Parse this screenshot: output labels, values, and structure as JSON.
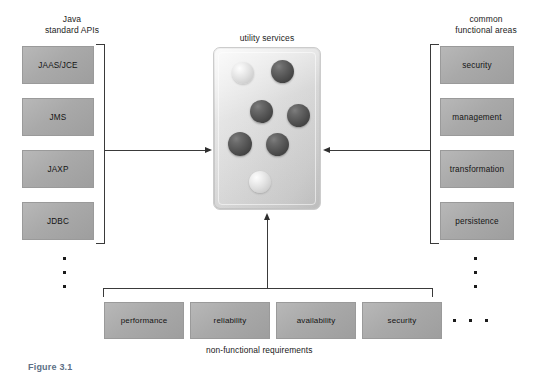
{
  "figure": {
    "caption": "Figure 3.1",
    "title_center": "utility services"
  },
  "left_group": {
    "caption": "Java\nstandard APIs",
    "items": [
      {
        "label": "JAAS/JCE"
      },
      {
        "label": "JMS"
      },
      {
        "label": "JAXP"
      },
      {
        "label": "JDBC"
      }
    ],
    "ellipsis": "vertical-3-dots"
  },
  "right_group": {
    "caption": "common\nfunctional areas",
    "items": [
      {
        "label": "security"
      },
      {
        "label": "management"
      },
      {
        "label": "transformation"
      },
      {
        "label": "persistence"
      }
    ],
    "ellipsis": "vertical-3-dots"
  },
  "bottom_group": {
    "caption": "non-functional requirements",
    "items": [
      {
        "label": "performance"
      },
      {
        "label": "reliability"
      },
      {
        "label": "availability"
      },
      {
        "label": "security"
      }
    ],
    "ellipsis": "horizontal-3-dots"
  },
  "center": {
    "label": "utility services",
    "spheres": [
      {
        "id": "sphere-1",
        "tone": "light",
        "x": 18,
        "y": 14,
        "d": 22
      },
      {
        "id": "sphere-2",
        "tone": "dark",
        "x": 57,
        "y": 12,
        "d": 23
      },
      {
        "id": "sphere-3",
        "tone": "dark",
        "x": 36,
        "y": 52,
        "d": 23
      },
      {
        "id": "sphere-4",
        "tone": "dark",
        "x": 73,
        "y": 56,
        "d": 23
      },
      {
        "id": "sphere-5",
        "tone": "dark",
        "x": 14,
        "y": 84,
        "d": 24
      },
      {
        "id": "sphere-6",
        "tone": "dark",
        "x": 52,
        "y": 85,
        "d": 23
      },
      {
        "id": "sphere-7",
        "tone": "light",
        "x": 35,
        "y": 123,
        "d": 22
      }
    ]
  },
  "colors": {
    "box_fill": "#ababab",
    "box_border": "#9a9a9a",
    "panel_fill": "#dedede",
    "line": "#3a3a3a",
    "sphere_light": "#e6e6e6",
    "sphere_dark": "#4e4e4e",
    "caption_text": "#5d6f86"
  }
}
